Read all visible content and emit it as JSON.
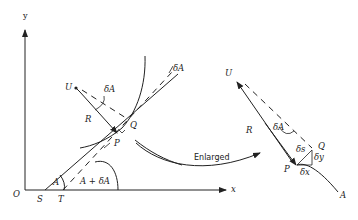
{
  "figure": {
    "colors": {
      "ink": "#222222",
      "background": "#ffffff"
    }
  },
  "left_panel": {
    "axis_labels": {
      "y": "y",
      "x": "x",
      "origin": "O"
    },
    "points": {
      "S": "S",
      "T": "T",
      "P": "P",
      "Q": "Q",
      "U": "U"
    },
    "angle_labels": {
      "A": "A",
      "A_plus_dA": "A + δA",
      "dA_top": "δA",
      "dA_centre": "δA"
    },
    "radius_label": "R"
  },
  "connector": {
    "label": "Enlarged"
  },
  "right_panel": {
    "points": {
      "U": "U",
      "P": "P",
      "Q": "Q",
      "A": "A"
    },
    "radius_label": "R",
    "angle_label": "δA",
    "increments": {
      "ds": "δs",
      "dy": "δy",
      "dx": "δx"
    }
  }
}
